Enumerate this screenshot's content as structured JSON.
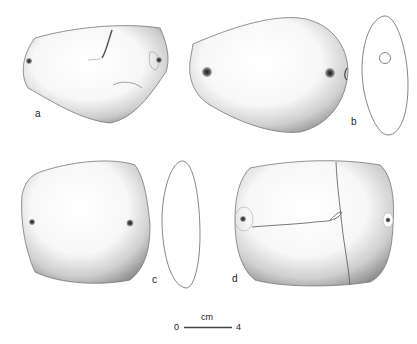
{
  "figure": {
    "objects": [
      {
        "id": "a",
        "label": "a",
        "view": "face",
        "perforations": 2
      },
      {
        "id": "b",
        "label": "b",
        "view": "face + profile",
        "perforations": 2
      },
      {
        "id": "c",
        "label": "c",
        "view": "face + profile",
        "perforations": 2
      },
      {
        "id": "d",
        "label": "d",
        "view": "face (fractured)",
        "perforations": 2
      }
    ],
    "scale_bar": {
      "unit": "cm",
      "start": "0",
      "end": "4"
    }
  },
  "colors": {
    "outline": "#555555",
    "shade": "#8a8a8a",
    "hole": "#333333",
    "background": "#ffffff"
  }
}
